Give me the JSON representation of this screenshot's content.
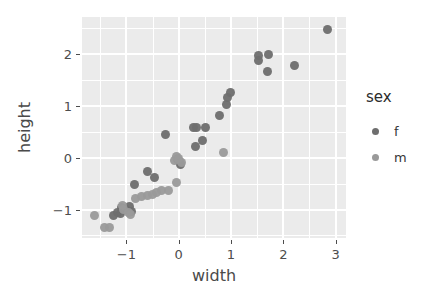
{
  "chart_data": {
    "type": "scatter",
    "title": "",
    "xlabel": "width",
    "ylabel": "height",
    "xlim": [
      -1.85,
      3.2
    ],
    "ylim": [
      -1.55,
      2.72
    ],
    "xticks": [
      -1,
      0,
      1,
      2,
      3
    ],
    "xtick_labels": [
      "−1",
      "0",
      "1",
      "2",
      "3"
    ],
    "yticks": [
      -1,
      0,
      1,
      2
    ],
    "ytick_labels": [
      "−1",
      "0",
      "1",
      "2"
    ],
    "grid": true,
    "grid_major": true,
    "grid_minor": true,
    "panel_background": "#ebebeb",
    "grid_color": "#ffffff",
    "legend": {
      "title": "sex",
      "position": "right",
      "entries": [
        {
          "label": "f",
          "color": "#6e6e6e"
        },
        {
          "label": "m",
          "color": "#9a9a9a"
        }
      ]
    },
    "series": [
      {
        "name": "f",
        "color": "#6e6e6e",
        "points": [
          {
            "x": -0.6,
            "y": -0.27
          },
          {
            "x": -0.85,
            "y": -0.52
          },
          {
            "x": -0.26,
            "y": 0.45
          },
          {
            "x": -0.47,
            "y": -0.38
          },
          {
            "x": 0.28,
            "y": 0.59
          },
          {
            "x": 0.34,
            "y": 0.59
          },
          {
            "x": 0.52,
            "y": 0.58
          },
          {
            "x": 0.45,
            "y": 0.33
          },
          {
            "x": 0.33,
            "y": 0.22
          },
          {
            "x": 0.78,
            "y": 0.82
          },
          {
            "x": 0.92,
            "y": 1.03
          },
          {
            "x": 0.94,
            "y": 1.17
          },
          {
            "x": 1.0,
            "y": 1.27
          },
          {
            "x": 1.52,
            "y": 1.98
          },
          {
            "x": 1.53,
            "y": 1.88
          },
          {
            "x": 1.72,
            "y": 2.0
          },
          {
            "x": 1.7,
            "y": 1.66
          },
          {
            "x": 2.22,
            "y": 1.78
          },
          {
            "x": 2.85,
            "y": 2.47
          },
          {
            "x": -0.95,
            "y": -0.95
          },
          {
            "x": -0.9,
            "y": -1.03
          },
          {
            "x": -1.02,
            "y": -1.0
          },
          {
            "x": -1.12,
            "y": -1.08
          },
          {
            "x": -1.1,
            "y": -0.97
          },
          {
            "x": -1.18,
            "y": -1.05
          },
          {
            "x": -1.25,
            "y": -1.12
          },
          {
            "x": 0.02,
            "y": -0.07
          },
          {
            "x": -0.03,
            "y": -0.03
          },
          {
            "x": 0.03,
            "y": -0.13
          }
        ]
      },
      {
        "name": "m",
        "color": "#9a9a9a",
        "points": [
          {
            "x": -1.62,
            "y": -1.12
          },
          {
            "x": -1.42,
            "y": -1.34
          },
          {
            "x": -1.33,
            "y": -1.34
          },
          {
            "x": -1.05,
            "y": -1.0
          },
          {
            "x": -1.08,
            "y": -0.93
          },
          {
            "x": -0.97,
            "y": -1.05
          },
          {
            "x": -0.93,
            "y": -1.09
          },
          {
            "x": -0.82,
            "y": -0.78
          },
          {
            "x": -0.72,
            "y": -0.75
          },
          {
            "x": -0.6,
            "y": -0.72
          },
          {
            "x": -0.5,
            "y": -0.7
          },
          {
            "x": -0.42,
            "y": -0.68
          },
          {
            "x": -0.33,
            "y": -0.63
          },
          {
            "x": -0.2,
            "y": -0.63
          },
          {
            "x": -0.05,
            "y": -0.48
          },
          {
            "x": -0.08,
            "y": -0.05
          },
          {
            "x": -0.05,
            "y": 0.02
          },
          {
            "x": 0.0,
            "y": -0.02
          },
          {
            "x": 0.05,
            "y": -0.1
          },
          {
            "x": 0.85,
            "y": 0.11
          }
        ]
      }
    ]
  }
}
